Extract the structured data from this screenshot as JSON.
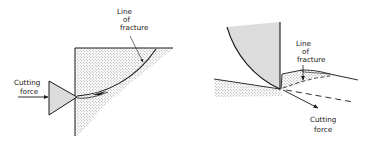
{
  "figure": {
    "left_panel": {
      "labels": {
        "cutting_force_line1": "Cutting",
        "cutting_force_line2": "force",
        "fracture_line1": "Line",
        "fracture_line2": "of",
        "fracture_line3": "fracture"
      }
    },
    "right_panel": {
      "labels": {
        "fracture_line1": "Line",
        "fracture_line2": "of",
        "fracture_line3": "fracture",
        "cutting_force_line1": "Cutting",
        "cutting_force_line2": "force"
      }
    },
    "colors": {
      "ink": "#1a1a1a",
      "tool_fill": "#dcdcdc",
      "stipple": "#8a8a8a",
      "background": "#ffffff"
    }
  }
}
